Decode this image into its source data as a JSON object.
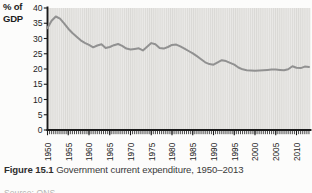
{
  "figure": {
    "caption_label": "Figure 15.1",
    "caption_text": " Government current expenditure, 1950–2013",
    "source": "Source: ONS"
  },
  "chart_data": {
    "type": "line",
    "title": "Government current expenditure, 1950–2013",
    "ylabel": "% of GDP",
    "ylabel_lines": {
      "line1": "% of",
      "line2": "GDP"
    },
    "xlabel": "",
    "legend": "none",
    "grid": "fine vertical stripe texture on plot background",
    "ylim": [
      0,
      40
    ],
    "ytick_step": 5,
    "yticks": [
      0,
      5,
      10,
      15,
      20,
      25,
      30,
      35,
      40
    ],
    "xticks": [
      1950,
      1955,
      1960,
      1965,
      1970,
      1975,
      1980,
      1985,
      1990,
      1995,
      2000,
      2005,
      2010
    ],
    "x_range": [
      1950,
      2013
    ],
    "x": [
      1950,
      1951,
      1952,
      1953,
      1954,
      1955,
      1956,
      1957,
      1958,
      1959,
      1960,
      1961,
      1962,
      1963,
      1964,
      1965,
      1966,
      1967,
      1968,
      1969,
      1970,
      1971,
      1972,
      1973,
      1974,
      1975,
      1976,
      1977,
      1978,
      1979,
      1980,
      1981,
      1982,
      1983,
      1984,
      1985,
      1986,
      1987,
      1988,
      1989,
      1990,
      1991,
      1992,
      1993,
      1994,
      1995,
      1996,
      1997,
      1998,
      1999,
      2000,
      2001,
      2002,
      2003,
      2004,
      2005,
      2006,
      2007,
      2008,
      2009,
      2010,
      2011,
      2012,
      2013
    ],
    "values": [
      33.4,
      35.8,
      37.2,
      36.5,
      35.0,
      33.2,
      31.8,
      30.6,
      29.4,
      28.6,
      27.9,
      27.1,
      27.7,
      28.1,
      26.9,
      27.2,
      27.8,
      28.2,
      27.6,
      26.7,
      26.4,
      26.6,
      26.8,
      26.1,
      27.3,
      28.5,
      28.1,
      26.9,
      26.7,
      27.2,
      27.9,
      28.0,
      27.4,
      26.7,
      25.9,
      25.1,
      24.2,
      23.2,
      22.2,
      21.6,
      21.4,
      22.2,
      22.9,
      22.6,
      22.0,
      21.4,
      20.5,
      19.9,
      19.6,
      19.5,
      19.4,
      19.5,
      19.6,
      19.7,
      19.8,
      19.8,
      19.7,
      19.6,
      19.9,
      20.9,
      20.4,
      20.3,
      20.8,
      20.7
    ],
    "colors": {
      "line": "#919191",
      "axis": "#1b1b1b",
      "tick_text": "#1e1e1e",
      "plot_bg": "#eae9e7",
      "stripe": "#d9d8d5",
      "caption": "#3a3a3a",
      "source": "#b5b4b2"
    }
  }
}
